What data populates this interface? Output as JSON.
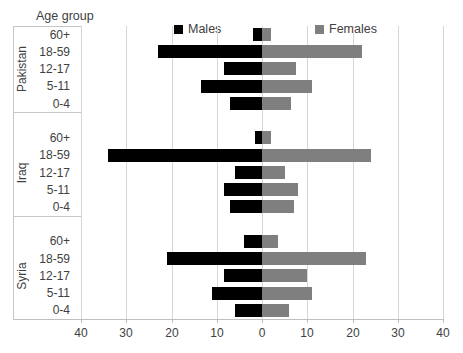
{
  "chart_data": {
    "type": "bar",
    "orientation": "horizontal-pyramid",
    "title": "Age group",
    "legend_position": "top-inside",
    "grid": true,
    "xlim": [
      -40,
      40
    ],
    "xticks": [
      -40,
      -30,
      -20,
      -10,
      0,
      10,
      20,
      30,
      40
    ],
    "xtick_labels": [
      "40",
      "30",
      "20",
      "10",
      "0",
      "10",
      "20",
      "30",
      "40"
    ],
    "series": [
      {
        "name": "Males",
        "color": "#000000",
        "direction": "left"
      },
      {
        "name": "Females",
        "color": "#7F7F7F",
        "direction": "right"
      }
    ],
    "categories": [
      "60+",
      "18-59",
      "12-17",
      "5-11",
      "0-4"
    ],
    "groups": [
      {
        "label": "Pakistan",
        "males": [
          2,
          23,
          8.5,
          13.5,
          7
        ],
        "females": [
          2,
          22,
          7.5,
          11,
          6.5
        ]
      },
      {
        "label": "Iraq",
        "males": [
          1.5,
          34,
          6,
          8.5,
          7
        ],
        "females": [
          2,
          24,
          5,
          8,
          7
        ]
      },
      {
        "label": "Syria",
        "males": [
          4,
          21,
          8.5,
          11,
          6
        ],
        "females": [
          3.5,
          23,
          10,
          11,
          6
        ]
      }
    ],
    "colors": {
      "grid": "#d6d6d6",
      "axis": "#bfbfbf",
      "label_box_border": "#c6c6c6",
      "text": "#404040",
      "background": "#ffffff"
    }
  }
}
